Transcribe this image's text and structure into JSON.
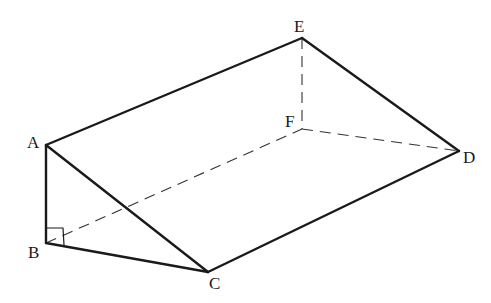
{
  "diagram": {
    "type": "triangular-prism",
    "vertices": {
      "A": {
        "label": "A",
        "x": 46,
        "y": 145,
        "label_x": 27,
        "label_y": 148
      },
      "B": {
        "label": "B",
        "x": 46,
        "y": 243,
        "label_x": 28,
        "label_y": 258
      },
      "C": {
        "label": "C",
        "x": 208,
        "y": 272,
        "label_x": 209,
        "label_y": 289
      },
      "D": {
        "label": "D",
        "x": 459,
        "y": 151,
        "label_x": 463,
        "label_y": 163
      },
      "E": {
        "label": "E",
        "x": 302,
        "y": 38,
        "label_x": 294,
        "label_y": 32
      },
      "F": {
        "label": "F",
        "x": 302,
        "y": 129,
        "label_x": 285,
        "label_y": 127
      }
    },
    "solid_edges": [
      {
        "name": "edge-AB",
        "from": "A",
        "to": "B"
      },
      {
        "name": "edge-BC",
        "from": "B",
        "to": "C"
      },
      {
        "name": "edge-AC",
        "from": "A",
        "to": "C"
      },
      {
        "name": "edge-AE",
        "from": "A",
        "to": "E"
      },
      {
        "name": "edge-ED",
        "from": "E",
        "to": "D"
      },
      {
        "name": "edge-CD",
        "from": "C",
        "to": "D"
      }
    ],
    "hidden_edges": [
      {
        "name": "edge-BF",
        "from": "B",
        "to": "F"
      },
      {
        "name": "edge-EF",
        "from": "E",
        "to": "F"
      },
      {
        "name": "edge-FD",
        "from": "F",
        "to": "D"
      }
    ],
    "right_angle_marker": {
      "vertex": "B",
      "size": 17
    },
    "colors": {
      "line": "#1a1a1a",
      "hidden_line": "#333333",
      "background": "#ffffff"
    }
  }
}
